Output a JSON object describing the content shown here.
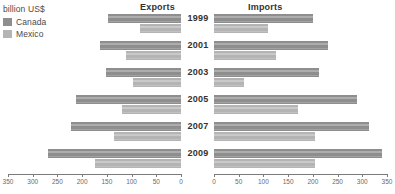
{
  "legend": {
    "unit_title": "billion US$",
    "entries": [
      {
        "label": "Canada",
        "color": "#8e8e8e",
        "name": "canada"
      },
      {
        "label": "Mexico",
        "color": "#b4b4b4",
        "name": "mexico"
      }
    ]
  },
  "panels": {
    "left_header": "Exports",
    "right_header": "Imports"
  },
  "chart_data": {
    "type": "bar",
    "title": "",
    "subtitle": "",
    "orientation": "horizontal",
    "layout": "bidirectional-tornado",
    "unit": "billion US$",
    "xlabel": "",
    "ylabel": "",
    "grid": false,
    "legend_position": "top-left",
    "categories": [
      "1999",
      "2001",
      "2003",
      "2005",
      "2007",
      "2009"
    ],
    "panels": [
      {
        "name": "Exports",
        "side": "left",
        "axis_reversed": true,
        "xlim": [
          0,
          350
        ],
        "ticks": [
          350,
          300,
          250,
          200,
          150,
          100,
          50,
          0
        ],
        "series": [
          {
            "name": "Canada",
            "color": "#8e8e8e",
            "values": [
              148,
              164,
              152,
              212,
              222,
              270
            ]
          },
          {
            "name": "Mexico",
            "color": "#b4b4b4",
            "values": [
              83,
              112,
              97,
              120,
              136,
              175
            ]
          }
        ]
      },
      {
        "name": "Imports",
        "side": "right",
        "axis_reversed": false,
        "xlim": [
          0,
          350
        ],
        "ticks": [
          0,
          50,
          100,
          150,
          200,
          250,
          300,
          350
        ],
        "series": [
          {
            "name": "Canada",
            "color": "#8e8e8e",
            "values": [
              200,
              230,
              212,
              290,
              313,
              340
            ]
          },
          {
            "name": "Mexico",
            "color": "#b4b4b4",
            "values": [
              110,
              125,
              60,
              170,
              205,
              205
            ]
          }
        ]
      }
    ]
  }
}
